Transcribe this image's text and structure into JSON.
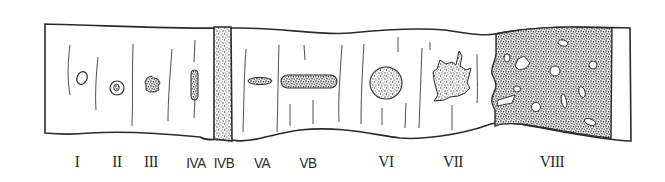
{
  "figure": {
    "stroke_color": "#2a2a2a",
    "stipple_color": "#3a3a3a",
    "background": "#ffffff"
  },
  "stages": [
    {
      "id": "I",
      "label": "I",
      "x": 77,
      "description": "small open oval"
    },
    {
      "id": "II",
      "label": "II",
      "x": 117,
      "description": "ring with dark center"
    },
    {
      "id": "III",
      "label": "III",
      "x": 151,
      "description": "small stippled irregular spot"
    },
    {
      "id": "IVA",
      "label": "IVA",
      "x": 195,
      "description": "vertical elongated stippled lesion"
    },
    {
      "id": "IVB",
      "label": "IVB",
      "x": 223,
      "description": "stippled band across strip"
    },
    {
      "id": "VA",
      "label": "VA",
      "x": 262,
      "description": "small horizontal stippled lesion"
    },
    {
      "id": "VB",
      "label": "VB",
      "x": 307,
      "description": "long horizontal stippled lesion"
    },
    {
      "id": "VI",
      "label": "VI",
      "x": 386,
      "description": "round stippled lesion"
    },
    {
      "id": "VII",
      "label": "VII",
      "x": 452,
      "description": "irregular stippled lesion"
    },
    {
      "id": "VIII",
      "label": "VIII",
      "x": 552,
      "description": "large stippled region with holes"
    }
  ]
}
